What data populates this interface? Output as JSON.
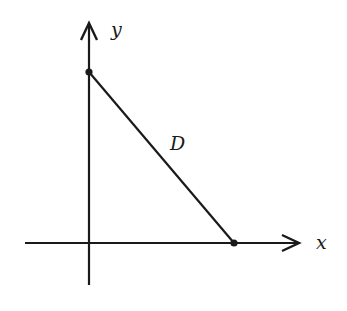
{
  "diagram": {
    "axes": {
      "x_label": "x",
      "y_label": "y"
    },
    "segment_label": "D",
    "points": [
      {
        "name": "y-intercept",
        "on": "y-axis"
      },
      {
        "name": "x-intercept",
        "on": "x-axis"
      }
    ],
    "colors": {
      "ink": "#1a1a1a",
      "background": "#ffffff"
    }
  }
}
